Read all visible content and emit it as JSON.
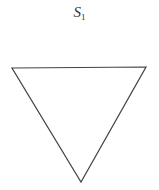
{
  "diagram": {
    "label": {
      "main": "S",
      "subscript": "1"
    },
    "shape": "inverted-triangle",
    "vertices": [
      [
        12,
        68
      ],
      [
        146,
        67
      ],
      [
        81,
        182
      ]
    ],
    "stroke_color": "#444444"
  }
}
